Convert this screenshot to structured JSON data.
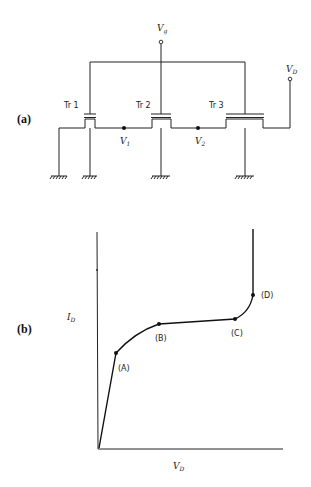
{
  "circuit": {
    "panel_label": "(a)",
    "gate_terminal": {
      "main": "V",
      "sub": "g"
    },
    "drain_terminal": {
      "main": "V",
      "sub": "D"
    },
    "transistors": [
      {
        "label": "Tr 1"
      },
      {
        "label": "Tr 2"
      },
      {
        "label": "Tr 3"
      }
    ],
    "nodes": [
      {
        "main": "V",
        "sub": "1"
      },
      {
        "main": "V",
        "sub": "2"
      }
    ]
  },
  "graph": {
    "panel_label": "(b)",
    "y_axis_label": {
      "main": "I",
      "sub": "D"
    },
    "x_axis_label": {
      "main": "V",
      "sub": "D"
    },
    "points": [
      {
        "label": "(A)"
      },
      {
        "label": "(B)"
      },
      {
        "label": "(C)"
      },
      {
        "label": "(D)"
      }
    ]
  }
}
